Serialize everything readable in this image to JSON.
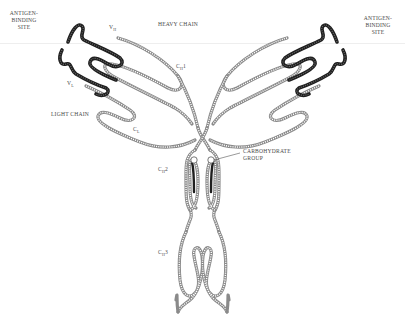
{
  "diagram": {
    "type": "antibody-structure",
    "labels": {
      "antigen_binding_left": [
        "ANTIGEN-",
        "BINDING",
        "SITE"
      ],
      "antigen_binding_right": [
        "ANTIGEN-",
        "BINDING",
        "SITE"
      ],
      "heavy_chain": "HEAVY CHAIN",
      "light_chain": "LIGHT CHAIN",
      "vh": {
        "main": "V",
        "sub": "H"
      },
      "vl": {
        "main": "V",
        "sub": "L"
      },
      "ch1": {
        "main": "C",
        "sub": "H",
        "suffix": "1"
      },
      "cl": {
        "main": "C",
        "sub": "L"
      },
      "ch2": {
        "main": "C",
        "sub": "H",
        "suffix": "2"
      },
      "ch3": {
        "main": "C",
        "sub": "H",
        "suffix": "3"
      },
      "carbohydrate": [
        "CARBOHYDRATE",
        "GROUP"
      ]
    },
    "colors": {
      "variable_region": "#1f1f1f",
      "constant_region": "#8a8a8a",
      "text": "#4a4a4a",
      "background": "#ffffff"
    }
  }
}
